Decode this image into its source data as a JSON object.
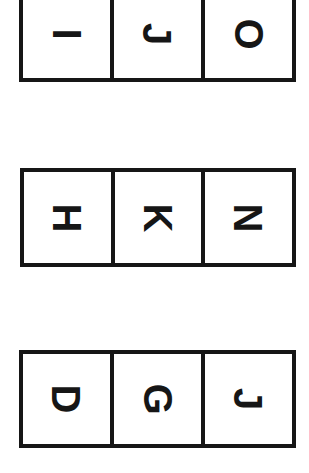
{
  "page": {
    "background_color": "#ffffff",
    "ink_color": "#161616",
    "orientation": "rotated-90-clockwise",
    "row_count": 3,
    "columns_per_row": 3
  },
  "rows": [
    {
      "name": "row-1",
      "clipped_top": true,
      "cells": [
        {
          "letter": "I"
        },
        {
          "letter": "J"
        },
        {
          "letter": "O"
        }
      ]
    },
    {
      "name": "row-2",
      "clipped_top": false,
      "cells": [
        {
          "letter": "H"
        },
        {
          "letter": "K"
        },
        {
          "letter": "N"
        }
      ]
    },
    {
      "name": "row-3",
      "clipped_top": false,
      "cells": [
        {
          "letter": "D"
        },
        {
          "letter": "G"
        },
        {
          "letter": "J"
        }
      ]
    }
  ]
}
